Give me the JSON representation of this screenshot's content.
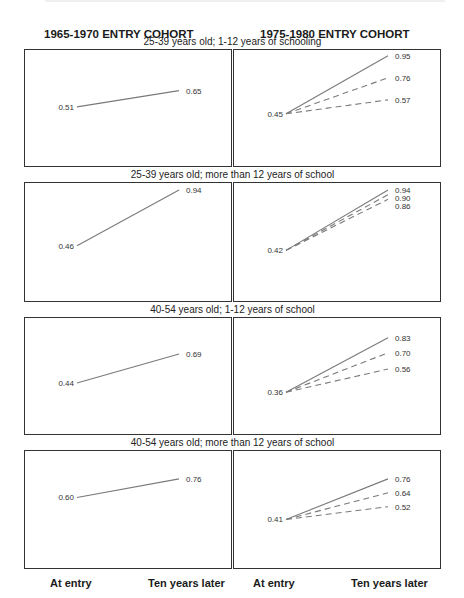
{
  "header": {
    "left_title": "1965-1970 ENTRY COHORT",
    "right_title": "1975-1980 ENTRY COHORT"
  },
  "x_labels": {
    "left": [
      "At entry",
      "Ten years later"
    ],
    "right": [
      "At entry",
      "Ten years later"
    ]
  },
  "rows": [
    {
      "title": "25-39 years old; 1-12 years of schooling",
      "left": {
        "start": "0.51",
        "end": "0.65"
      },
      "right": {
        "start": "0.45",
        "ends": [
          "0.95",
          "0.76",
          "0.57"
        ]
      }
    },
    {
      "title": "25-39 years old; more than 12 years of school",
      "left": {
        "start": "0.46",
        "end": "0.94"
      },
      "right": {
        "start": "0.42",
        "ends": [
          "0.94",
          "0.90",
          "0.86"
        ]
      }
    },
    {
      "title": "40-54 years old; 1-12 years of school",
      "left": {
        "start": "0.44",
        "end": "0.69"
      },
      "right": {
        "start": "0.36",
        "ends": [
          "0.83",
          "0.70",
          "0.56"
        ]
      }
    },
    {
      "title": "40-54 years old; more than 12 years of school",
      "left": {
        "start": "0.60",
        "end": "0.76"
      },
      "right": {
        "start": "0.41",
        "ends": [
          "0.76",
          "0.64",
          "0.52"
        ]
      }
    }
  ],
  "colors": {
    "line": "#7a7a7a",
    "border": "#333333",
    "text": "#1a1a1a"
  },
  "chart_data": {
    "type": "line",
    "title": "",
    "column_titles": [
      "1965-1970 ENTRY COHORT",
      "1975-1980 ENTRY COHORT"
    ],
    "categories": [
      "At entry",
      "Ten years later"
    ],
    "xlabel": "",
    "ylabel": "",
    "grid": false,
    "legend": "none",
    "panels": [
      {
        "row": "25-39 years old; 1-12 years of schooling",
        "cohort": "1965-1970",
        "series": [
          {
            "name": "observed",
            "style": "solid",
            "values": [
              0.51,
              0.65
            ]
          }
        ]
      },
      {
        "row": "25-39 years old; 1-12 years of schooling",
        "cohort": "1975-1980",
        "series": [
          {
            "name": "line 1",
            "style": "solid",
            "values": [
              0.45,
              0.95
            ]
          },
          {
            "name": "line 2",
            "style": "dashed",
            "values": [
              0.45,
              0.76
            ]
          },
          {
            "name": "line 3",
            "style": "dashed",
            "values": [
              0.45,
              0.57
            ]
          }
        ]
      },
      {
        "row": "25-39 years old; more than 12 years of school",
        "cohort": "1965-1970",
        "series": [
          {
            "name": "observed",
            "style": "solid",
            "values": [
              0.46,
              0.94
            ]
          }
        ]
      },
      {
        "row": "25-39 years old; more than 12 years of school",
        "cohort": "1975-1980",
        "series": [
          {
            "name": "line 1",
            "style": "solid",
            "values": [
              0.42,
              0.94
            ]
          },
          {
            "name": "line 2",
            "style": "dashed",
            "values": [
              0.42,
              0.9
            ]
          },
          {
            "name": "line 3",
            "style": "dashed",
            "values": [
              0.42,
              0.86
            ]
          }
        ]
      },
      {
        "row": "40-54 years old; 1-12 years of school",
        "cohort": "1965-1970",
        "series": [
          {
            "name": "observed",
            "style": "solid",
            "values": [
              0.44,
              0.69
            ]
          }
        ]
      },
      {
        "row": "40-54 years old; 1-12 years of school",
        "cohort": "1975-1980",
        "series": [
          {
            "name": "line 1",
            "style": "solid",
            "values": [
              0.36,
              0.83
            ]
          },
          {
            "name": "line 2",
            "style": "dashed",
            "values": [
              0.36,
              0.7
            ]
          },
          {
            "name": "line 3",
            "style": "dashed",
            "values": [
              0.36,
              0.56
            ]
          }
        ]
      },
      {
        "row": "40-54 years old; more than 12 years of school",
        "cohort": "1965-1970",
        "series": [
          {
            "name": "observed",
            "style": "solid",
            "values": [
              0.6,
              0.76
            ]
          }
        ]
      },
      {
        "row": "40-54 years old; more than 12 years of school",
        "cohort": "1975-1980",
        "series": [
          {
            "name": "line 1",
            "style": "solid",
            "values": [
              0.41,
              0.76
            ]
          },
          {
            "name": "line 2",
            "style": "dashed",
            "values": [
              0.41,
              0.64
            ]
          },
          {
            "name": "line 3",
            "style": "dashed",
            "values": [
              0.41,
              0.52
            ]
          }
        ]
      }
    ]
  }
}
